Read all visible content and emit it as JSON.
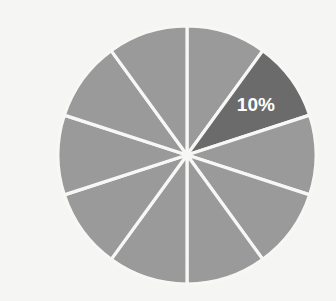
{
  "chart_data": {
    "type": "pie",
    "title": "",
    "subtitle": "",
    "xlabel": "",
    "ylabel": "",
    "grid": false,
    "legend": "none",
    "background_color": "#f5f5f3",
    "start_angle_deg": 90,
    "direction": "clockwise",
    "center": {
      "x": 187,
      "y": 155
    },
    "radius": 129,
    "separator_color": "#f7f7f5",
    "separator_width": 3.2,
    "base_color": "#9a9a9a",
    "highlight_color": "#6b6b6b",
    "label_color": "#ffffff",
    "slices": [
      {
        "index": 0,
        "value": 10,
        "label": "",
        "color": "#9a9a9a",
        "start_deg": 0,
        "end_deg": 36,
        "highlighted": false
      },
      {
        "index": 1,
        "value": 10,
        "label": "10%",
        "color": "#6b6b6b",
        "start_deg": 36,
        "end_deg": 72,
        "highlighted": true
      },
      {
        "index": 2,
        "value": 10,
        "label": "",
        "color": "#9a9a9a",
        "start_deg": 72,
        "end_deg": 108,
        "highlighted": false
      },
      {
        "index": 3,
        "value": 10,
        "label": "",
        "color": "#9a9a9a",
        "start_deg": 108,
        "end_deg": 144,
        "highlighted": false
      },
      {
        "index": 4,
        "value": 10,
        "label": "",
        "color": "#9a9a9a",
        "start_deg": 144,
        "end_deg": 180,
        "highlighted": false
      },
      {
        "index": 5,
        "value": 10,
        "label": "",
        "color": "#9a9a9a",
        "start_deg": 180,
        "end_deg": 216,
        "highlighted": false
      },
      {
        "index": 6,
        "value": 10,
        "label": "",
        "color": "#9a9a9a",
        "start_deg": 216,
        "end_deg": 252,
        "highlighted": false
      },
      {
        "index": 7,
        "value": 10,
        "label": "",
        "color": "#9a9a9a",
        "start_deg": 252,
        "end_deg": 288,
        "highlighted": false
      },
      {
        "index": 8,
        "value": 10,
        "label": "",
        "color": "#9a9a9a",
        "start_deg": 288,
        "end_deg": 324,
        "highlighted": false
      },
      {
        "index": 9,
        "value": 10,
        "label": "",
        "color": "#9a9a9a",
        "start_deg": 324,
        "end_deg": 360,
        "highlighted": false
      }
    ],
    "values": [
      10,
      10,
      10,
      10,
      10,
      10,
      10,
      10,
      10,
      10
    ],
    "categories": [
      "",
      "",
      "",
      "",
      "",
      "",
      "",
      "",
      "",
      ""
    ],
    "labels_shown": [
      "10%"
    ]
  }
}
